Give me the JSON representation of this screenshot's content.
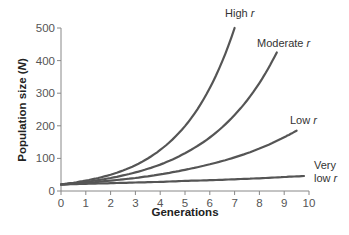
{
  "chart_data": {
    "type": "line",
    "title": "",
    "xlabel": "Generations",
    "ylabel": "Population size (N)",
    "ylabel_parts": {
      "text": "Population size (",
      "var": "N",
      "close": ")"
    },
    "xlim": [
      0,
      10
    ],
    "ylim": [
      0,
      500
    ],
    "x_ticks": [
      0,
      1,
      2,
      3,
      4,
      5,
      6,
      7,
      8,
      9,
      10
    ],
    "y_ticks": [
      0,
      100,
      200,
      300,
      400,
      500
    ],
    "grid": false,
    "legend": "inline labels at curve ends",
    "series": [
      {
        "name": "High r",
        "label_text": "High ",
        "label_var": "r",
        "x": [
          0,
          1,
          2,
          3,
          4,
          5,
          6,
          7
        ],
        "values": [
          20,
          32,
          50,
          79,
          126,
          199,
          316,
          500
        ]
      },
      {
        "name": "Moderate r",
        "label_text": "Moderate ",
        "label_var": "r",
        "x": [
          0,
          1,
          2,
          3,
          4,
          5,
          6,
          7,
          8,
          8.7
        ],
        "values": [
          20,
          28,
          40,
          57,
          81,
          116,
          164,
          233,
          331,
          425
        ]
      },
      {
        "name": "Low r",
        "label_text": "Low ",
        "label_var": "r",
        "x": [
          0,
          1,
          2,
          3,
          4,
          5,
          6,
          7,
          8,
          9,
          9.5
        ],
        "values": [
          20,
          25,
          32,
          40,
          51,
          65,
          82,
          103,
          130,
          165,
          185
        ]
      },
      {
        "name": "Very low r",
        "label_text": "Very",
        "label_text2": "low ",
        "label_var": "r",
        "x": [
          0,
          1,
          2,
          3,
          4,
          5,
          6,
          7,
          8,
          9,
          9.8
        ],
        "values": [
          20,
          22,
          24,
          26,
          28,
          31,
          33,
          36,
          39,
          43,
          46
        ]
      }
    ]
  }
}
